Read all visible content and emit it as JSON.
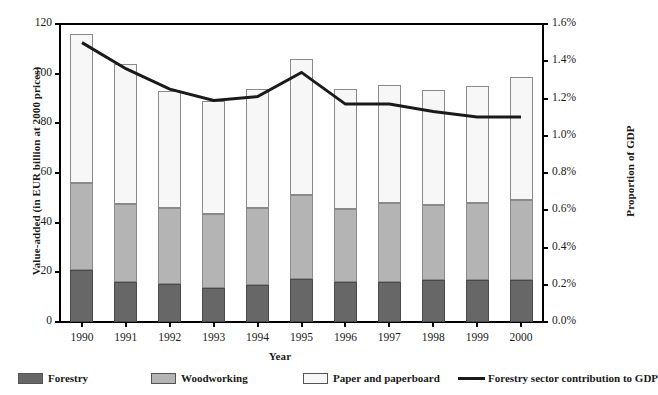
{
  "chart_data": {
    "type": "bar",
    "subtype": "stacked-bar-with-line-overlay",
    "title": "",
    "xlabel": "Year",
    "ylabel": "Value-added (in EUR billion at 2000 prices)",
    "y2label": "Proportion of GDP",
    "categories": [
      "1990",
      "1991",
      "1992",
      "1993",
      "1994",
      "1995",
      "1996",
      "1997",
      "1998",
      "1999",
      "2000"
    ],
    "ylim": [
      0,
      120
    ],
    "yticks": [
      "0",
      "20",
      "40",
      "60",
      "80",
      "100",
      "120"
    ],
    "y2lim": [
      0.0,
      1.6
    ],
    "y2ticks": [
      "0.0%",
      "0.2%",
      "0.4%",
      "0.6%",
      "0.8%",
      "1.0%",
      "1.2%",
      "1.4%",
      "1.6%"
    ],
    "grid": false,
    "legend_position": "bottom",
    "series": [
      {
        "name": "Forestry",
        "axis": "left",
        "color": "#676767",
        "values": [
          21,
          16,
          15.5,
          13.5,
          15,
          17.5,
          16,
          16,
          17,
          17,
          17
        ]
      },
      {
        "name": "Woodworking",
        "axis": "left",
        "color": "#b4b4b4",
        "values": [
          35,
          31.5,
          30.5,
          30,
          31,
          33.5,
          29.5,
          32,
          30,
          31,
          32
        ]
      },
      {
        "name": "Paper and paperboard",
        "axis": "left",
        "color": "#f7f7f7",
        "values": [
          60,
          56.5,
          47,
          45.5,
          48,
          55,
          48.5,
          47.5,
          46.5,
          47,
          49.5
        ]
      },
      {
        "name": "Forestry sector contribution to GDP",
        "axis": "right",
        "type": "line",
        "color": "#1a1a1a",
        "values": [
          1.5,
          1.36,
          1.25,
          1.19,
          1.21,
          1.34,
          1.17,
          1.17,
          1.13,
          1.1,
          1.1
        ]
      }
    ],
    "totals": [
      116,
      104,
      93,
      89,
      94,
      106,
      94,
      95.5,
      93.5,
      95,
      98.5
    ]
  },
  "legend": {
    "items": [
      {
        "label": "Forestry",
        "marker": "swatch",
        "color": "#676767"
      },
      {
        "label": "Woodworking",
        "marker": "swatch",
        "color": "#b4b4b4"
      },
      {
        "label": "Paper and paperboard",
        "marker": "swatch",
        "color": "#f7f7f7"
      },
      {
        "label": "Forestry sector contribution to GDP",
        "marker": "line",
        "color": "#1a1a1a"
      }
    ]
  }
}
